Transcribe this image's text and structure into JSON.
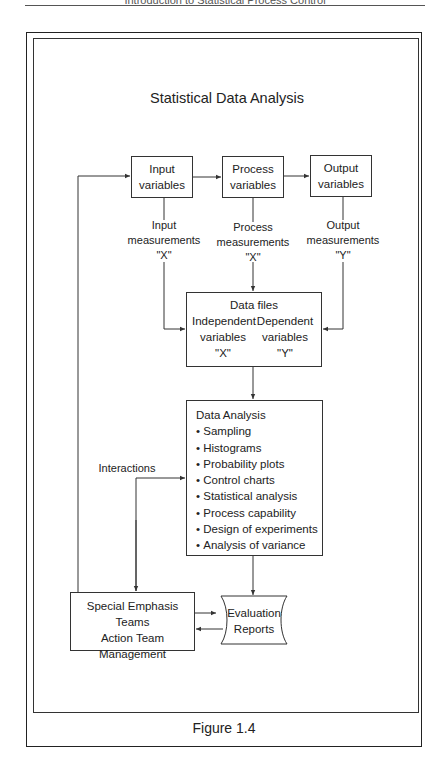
{
  "page": {
    "running_head": "Introduction to Statistical Process Control",
    "caption": "Figure 1.4"
  },
  "diagram": {
    "title": "Statistical Data Analysis",
    "variables": [
      {
        "line1": "Input",
        "line2": "variables"
      },
      {
        "line1": "Process",
        "line2": "variables"
      },
      {
        "line1": "Output",
        "line2": "variables"
      }
    ],
    "measurements": [
      {
        "line1": "Input",
        "line2": "measurements",
        "symbol": "\"X\""
      },
      {
        "line1": "Process",
        "line2": "measurements",
        "symbol": "\"X\""
      },
      {
        "line1": "Output",
        "line2": "measurements",
        "symbol": "\"Y\""
      }
    ],
    "data_files": {
      "title": "Data files",
      "independent": {
        "line1": "Independent",
        "line2": "variables",
        "symbol": "\"X\""
      },
      "dependent": {
        "line1": "Dependent",
        "line2": "variables",
        "symbol": "\"Y\""
      }
    },
    "data_analysis": {
      "title": "Data Analysis",
      "items": [
        "Sampling",
        "Histograms",
        "Probability plots",
        "Control charts",
        "Statistical analysis",
        "Process capability",
        "Design of experiments",
        "Analysis of variance"
      ]
    },
    "interactions_label": "Interactions",
    "teams": {
      "line1": "Special Emphasis Teams",
      "line2": "Action Team",
      "line3": "Management"
    },
    "reports": {
      "line1": "Evaluation",
      "line2": "Reports"
    }
  }
}
